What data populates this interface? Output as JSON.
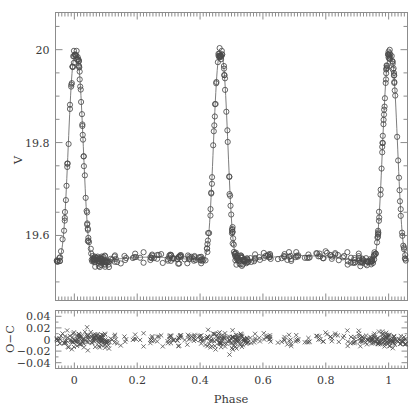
{
  "figure": {
    "name": "eclipsing-binary-light-curve",
    "background": "#ffffff",
    "ink_color": "#4a4a4a",
    "axis_color": "#8c8c8c"
  },
  "main_panel": {
    "ylabel": "V",
    "ytick_labels": [
      "19.6",
      "19.8",
      "20"
    ],
    "ytick_values": [
      19.6,
      19.8,
      20.0
    ],
    "ylim": [
      20.08,
      19.46
    ],
    "xlim": [
      -0.06,
      1.06
    ],
    "marker": "open-circle"
  },
  "residual_panel": {
    "ylabel": "O−C",
    "ytick_labels": [
      "0.04",
      "0.02",
      "0",
      "−0.02",
      "−0.04"
    ],
    "ytick_values": [
      0.04,
      0.02,
      0,
      -0.02,
      -0.04
    ],
    "ylim": [
      -0.05,
      0.05
    ],
    "xlim": [
      -0.06,
      1.06
    ],
    "marker": "cross"
  },
  "xaxis": {
    "label": "Phase",
    "tick_labels": [
      "0",
      "0.2",
      "0.4",
      "0.6",
      "0.8",
      "1"
    ],
    "tick_values": [
      0,
      0.2,
      0.4,
      0.6,
      0.8,
      1.0
    ],
    "minor_tick_step": 0.05
  },
  "chart_data": {
    "type": "scatter",
    "title": "",
    "xlabel": "Phase",
    "ylabel": "V",
    "xlim": [
      -0.06,
      1.06
    ],
    "ylim": [
      20.08,
      19.46
    ],
    "grid": false,
    "legend": null,
    "series": [
      {
        "name": "V magnitude observations",
        "marker": "open-circle",
        "panel": "main",
        "x": [
          -0.055,
          -0.052,
          -0.05,
          -0.047,
          -0.044,
          -0.041,
          -0.038,
          -0.034,
          -0.031,
          -0.028,
          -0.025,
          -0.022,
          -0.019,
          -0.016,
          -0.013,
          -0.01,
          -0.007,
          -0.004,
          -0.001,
          0.002,
          0.005,
          0.008,
          0.011,
          0.014,
          0.017,
          0.02,
          0.023,
          0.026,
          0.029,
          0.032,
          0.035,
          0.038,
          0.041,
          0.044,
          0.047,
          0.05,
          0.053,
          0.056,
          0.059,
          0.062,
          0.065,
          0.068,
          0.071,
          0.074,
          0.077,
          0.08,
          0.083,
          0.086,
          0.089,
          0.092,
          0.095,
          0.098,
          0.101,
          0.104,
          0.107,
          0.11,
          0.113,
          0.118,
          0.124,
          0.13,
          0.14,
          0.152,
          0.165,
          0.178,
          0.192,
          0.206,
          0.22,
          0.234,
          0.248,
          0.258,
          0.266,
          0.274,
          0.282,
          0.29,
          0.298,
          0.306,
          0.312,
          0.318,
          0.324,
          0.33,
          0.336,
          0.342,
          0.348,
          0.354,
          0.36,
          0.366,
          0.372,
          0.378,
          0.384,
          0.39,
          0.396,
          0.402,
          0.408,
          0.413,
          0.418,
          0.423,
          0.427,
          0.431,
          0.435,
          0.439,
          0.443,
          0.447,
          0.451,
          0.454,
          0.457,
          0.46,
          0.462,
          0.464,
          0.466,
          0.468,
          0.47,
          0.473,
          0.476,
          0.479,
          0.483,
          0.487,
          0.491,
          0.496,
          0.501,
          0.506,
          0.511,
          0.516,
          0.521,
          0.526,
          0.531,
          0.536,
          0.541,
          0.546,
          0.551,
          0.556,
          0.562,
          0.57,
          0.58,
          0.592,
          0.605,
          0.618,
          0.631,
          0.644,
          0.657,
          0.67,
          0.683,
          0.696,
          0.709,
          0.722,
          0.735,
          0.748,
          0.761,
          0.774,
          0.787,
          0.8,
          0.813,
          0.826,
          0.839,
          0.852,
          0.865,
          0.878,
          0.891,
          0.901,
          0.91,
          0.918,
          0.925,
          0.931,
          0.936,
          0.941,
          0.946,
          0.95,
          0.954,
          0.958,
          0.962,
          0.966,
          0.97,
          0.974,
          0.977,
          0.98,
          0.983,
          0.986,
          0.989,
          0.992,
          0.995,
          0.998,
          1.001,
          1.004,
          1.007,
          1.01,
          1.013,
          1.016,
          1.019,
          1.022,
          1.026,
          1.03,
          1.034,
          1.038,
          1.042,
          1.046,
          1.05,
          1.054,
          1.058
        ],
        "y": [
          19.722,
          19.752,
          19.768,
          19.78,
          19.792,
          19.812,
          19.828,
          19.848,
          19.866,
          19.884,
          19.902,
          19.92,
          19.938,
          19.952,
          19.966,
          19.978,
          19.986,
          19.992,
          19.996,
          19.998,
          19.998,
          19.996,
          19.99,
          19.982,
          19.968,
          19.95,
          19.928,
          19.902,
          19.874,
          19.846,
          19.816,
          19.786,
          19.758,
          19.73,
          19.706,
          19.684,
          19.664,
          19.648,
          19.634,
          19.622,
          19.612,
          19.604,
          19.598,
          19.592,
          19.588,
          19.584,
          19.58,
          19.578,
          19.576,
          19.574,
          19.572,
          19.571,
          19.57,
          19.57,
          19.569,
          19.569,
          19.568,
          19.567,
          19.566,
          19.565,
          19.563,
          19.561,
          19.559,
          19.557,
          19.555,
          19.553,
          19.552,
          19.551,
          19.55,
          19.55,
          19.55,
          19.55,
          19.551,
          19.551,
          19.552,
          19.553,
          19.553,
          19.554,
          19.554,
          19.555,
          19.556,
          19.557,
          19.558,
          19.559,
          19.561,
          19.563,
          19.566,
          19.57,
          19.575,
          19.582,
          19.592,
          19.606,
          19.624,
          19.644,
          19.668,
          19.696,
          19.724,
          19.754,
          19.786,
          19.818,
          19.85,
          19.882,
          19.912,
          19.936,
          19.956,
          19.972,
          19.982,
          19.99,
          19.994,
          19.996,
          19.994,
          19.988,
          19.976,
          19.958,
          19.932,
          19.9,
          19.864,
          19.82,
          19.776,
          19.734,
          19.698,
          19.668,
          19.644,
          19.624,
          19.608,
          19.596,
          19.586,
          19.578,
          19.572,
          19.568,
          19.564,
          19.56,
          19.556,
          19.553,
          19.551,
          19.549,
          19.548,
          19.547,
          19.547,
          19.547,
          19.547,
          19.548,
          19.548,
          19.549,
          19.55,
          19.551,
          19.552,
          19.553,
          19.554,
          19.556,
          19.557,
          19.559,
          19.561,
          19.563,
          19.566,
          19.57,
          19.576,
          19.582,
          19.59,
          19.6,
          19.612,
          19.626,
          19.642,
          19.66,
          19.68,
          19.702,
          19.724,
          19.746,
          19.768,
          19.79,
          19.812,
          19.834,
          19.852,
          19.87,
          19.886,
          19.902,
          19.918,
          19.932,
          19.946,
          19.958,
          19.968,
          19.978,
          19.986,
          19.992,
          19.996,
          19.998,
          19.998,
          19.996,
          19.99,
          19.98,
          19.964,
          19.944,
          19.918,
          19.89,
          19.858,
          19.824,
          19.788
        ]
      },
      {
        "name": "model fit",
        "marker": "line",
        "panel": "main"
      },
      {
        "name": "O-C residuals",
        "marker": "cross",
        "panel": "residual"
      }
    ]
  }
}
